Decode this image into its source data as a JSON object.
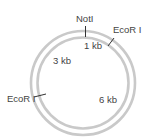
{
  "diagram": {
    "type": "plasmid-map",
    "center": [
      83,
      83
    ],
    "ring_color": "#c9c9c9",
    "tick_color": "#333333",
    "text_color": "#444444",
    "sites": [
      {
        "name": "NotI",
        "label": "NotI"
      },
      {
        "name": "EcoRI-right",
        "label": "EcoR I"
      },
      {
        "name": "EcoRI-left",
        "label": "EcoR I"
      }
    ],
    "segments": [
      {
        "label": "1 kb"
      },
      {
        "label": "3 kb"
      },
      {
        "label": "6 kb"
      }
    ]
  }
}
